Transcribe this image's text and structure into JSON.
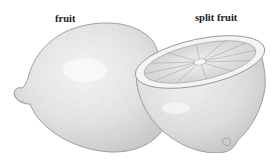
{
  "figure": {
    "labels": [
      {
        "id": "fruit",
        "text": "fruit"
      },
      {
        "id": "split_fruit",
        "text": "split fruit"
      }
    ],
    "colors": {
      "background": "#ffffff",
      "rind_fill": "#eeeeee",
      "rind_shade": "#cfcfcf",
      "outline": "#8a8a8a",
      "pulp": "#d9d9d9",
      "segment_line": "#a0a0a0",
      "label_text": "#1a1a1a"
    }
  }
}
